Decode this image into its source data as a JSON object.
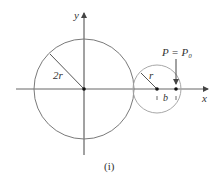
{
  "figure": {
    "caption": "(i)",
    "axis_labels": {
      "x": "x",
      "y": "y"
    },
    "big_circle": {
      "radius_label": "2r"
    },
    "small_circle": {
      "radius_label": "r"
    },
    "point_label": "P = P₀",
    "offset_label": "b",
    "colors": {
      "axis": "#555555",
      "big_circle": "#7a7a7a",
      "small_circle": "#a8a8a8",
      "text": "#333333"
    }
  }
}
